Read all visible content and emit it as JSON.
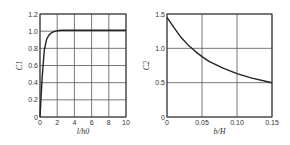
{
  "chart_data": [
    {
      "type": "line",
      "title": "",
      "xlabel": "l/h0",
      "ylabel": "C1",
      "xlim": [
        0,
        10
      ],
      "ylim": [
        0,
        1.2
      ],
      "xticks": [
        "0",
        "2",
        "4",
        "6",
        "8",
        "10"
      ],
      "yticks": [
        "0",
        "0.2",
        "0.4",
        "0.6",
        "0.8",
        "1.0",
        "1.2"
      ],
      "grid": true,
      "series": [
        {
          "name": "C1",
          "x": [
            0,
            0.25,
            0.5,
            0.75,
            1.0,
            1.25,
            1.5,
            2.0,
            2.5,
            3,
            4,
            6,
            8,
            10
          ],
          "y": [
            0,
            0.45,
            0.78,
            0.9,
            0.95,
            0.975,
            0.99,
            1.005,
            1.01,
            1.01,
            1.01,
            1.01,
            1.01,
            1.01
          ]
        }
      ]
    },
    {
      "type": "line",
      "title": "",
      "xlabel": "b/H",
      "ylabel": "C2",
      "xlim": [
        0,
        0.15
      ],
      "ylim": [
        0,
        1.5
      ],
      "xticks": [
        "0",
        "0.05",
        "0.10",
        "0.15"
      ],
      "yticks": [
        "0",
        "0.5",
        "1.0",
        "1.5"
      ],
      "grid": true,
      "series": [
        {
          "name": "C2",
          "x": [
            0,
            0.01,
            0.02,
            0.03,
            0.04,
            0.05,
            0.06,
            0.08,
            0.1,
            0.12,
            0.15
          ],
          "y": [
            1.45,
            1.3,
            1.16,
            1.05,
            0.96,
            0.88,
            0.81,
            0.71,
            0.63,
            0.57,
            0.5
          ]
        }
      ]
    }
  ]
}
